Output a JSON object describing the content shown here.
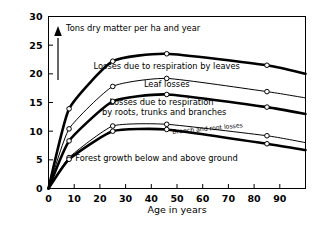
{
  "chart_data": {
    "type": "line",
    "title": "",
    "xlabel": "Age in years",
    "ylabel": "Tons dry matter per ha and year",
    "xlim": [
      0,
      100
    ],
    "ylim": [
      0,
      30
    ],
    "grid": false,
    "legend_position": "inline-labels",
    "xticks": [
      0,
      10,
      20,
      30,
      40,
      50,
      60,
      70,
      80,
      90
    ],
    "xticklabels": [
      "0",
      "10",
      "20",
      "30",
      "40",
      "50",
      "60",
      "70",
      "80",
      "90"
    ],
    "yticks": [
      0,
      5,
      10,
      15,
      20,
      25,
      30
    ],
    "yticklabels": [
      "0",
      "5",
      "10",
      "15",
      "20",
      "25",
      "30"
    ],
    "x": [
      0,
      8,
      25,
      46,
      85,
      100
    ],
    "series": [
      {
        "name": "Total (top of losses due to respiration by leaves)",
        "style": "thick",
        "values": [
          0,
          13.9,
          22.2,
          23.5,
          21.5,
          20.0
        ]
      },
      {
        "name": "Top of leaf losses",
        "style": "thin",
        "values": [
          0,
          10.4,
          17.8,
          19.2,
          16.9,
          15.8
        ]
      },
      {
        "name": "Top of losses due to respiration by roots, trunks and branches",
        "style": "thick",
        "values": [
          0,
          8.3,
          15.2,
          16.4,
          14.2,
          13.0
        ]
      },
      {
        "name": "Top of branch and root losses",
        "style": "thin",
        "values": [
          0,
          5.4,
          10.9,
          11.2,
          9.2,
          8.0
        ]
      },
      {
        "name": "Forest growth below and above ground",
        "style": "thick",
        "values": [
          0,
          5.1,
          10.0,
          10.3,
          7.8,
          6.7
        ]
      }
    ],
    "band_labels": [
      {
        "text": "Losses due to respiration by leaves",
        "x": 46,
        "y": 20.9,
        "size": "normal"
      },
      {
        "text": "Leaf losses",
        "x": 46,
        "y": 17.7,
        "size": "normal"
      },
      {
        "text": "Losses due to respiration",
        "x": 44,
        "y": 14.6,
        "size": "normal"
      },
      {
        "text": "by roots, trunks and branches",
        "x": 45,
        "y": 12.9,
        "size": "normal"
      },
      {
        "text": "Branch and root losses",
        "x": 62,
        "y": 10.1,
        "size": "small"
      },
      {
        "text": "Forest growth below and above ground",
        "x": 42,
        "y": 4.8,
        "size": "normal"
      }
    ]
  }
}
